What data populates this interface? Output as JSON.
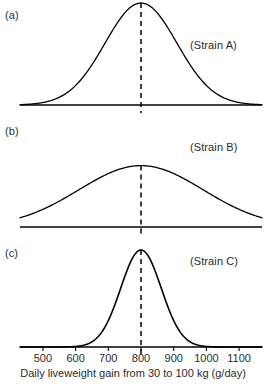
{
  "figure": {
    "panels": [
      {
        "tag": "(a)",
        "strain": "(Strain A)"
      },
      {
        "tag": "(b)",
        "strain": "(Strain B)"
      },
      {
        "tag": "(c)",
        "strain": "(Strain C)"
      }
    ],
    "axis_title": "Daily liveweight gain from 30 to 100 kg (g/day)",
    "tick_labels": [
      "500",
      "600",
      "700",
      "800",
      "900",
      "1000",
      "1100"
    ],
    "line_color": "#000000",
    "background_color": "#ffffff"
  },
  "chart_data": {
    "type": "line",
    "title": "",
    "xlabel": "Daily liveweight gain from 30 to 100 kg (g/day)",
    "ylabel": "",
    "xlim": [
      430,
      1170
    ],
    "xticks": [
      500,
      600,
      700,
      800,
      900,
      1000,
      1100
    ],
    "grid": false,
    "legend": "none",
    "annotations": [
      "(a)",
      "(Strain A)",
      "(b)",
      "(Strain B)",
      "(c)",
      "(Strain C)"
    ],
    "series": [
      {
        "name": "(Strain A)",
        "panel": "(a)",
        "label": "(Strain A)",
        "distribution": "normal",
        "mean": 800,
        "sd": 110,
        "peak_relative_height": 1.0,
        "visible_range": [
          470,
          1130
        ],
        "mean_line": {
          "style": "dashed",
          "x": 800
        }
      },
      {
        "name": "(Strain B)",
        "panel": "(b)",
        "label": "(Strain B)",
        "distribution": "normal",
        "mean": 800,
        "sd": 190,
        "peak_relative_height": 0.62,
        "visible_range": [
          440,
          1165
        ],
        "mean_line": {
          "style": "dashed",
          "x": 800
        }
      },
      {
        "name": "(Strain C)",
        "panel": "(c)",
        "label": "(Strain C)",
        "distribution": "normal",
        "mean": 800,
        "sd": 62,
        "peak_relative_height": 1.0,
        "visible_range": [
          610,
          990
        ],
        "mean_line": {
          "style": "dashed",
          "x": 800
        }
      }
    ]
  }
}
